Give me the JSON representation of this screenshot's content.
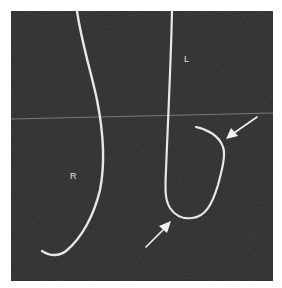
{
  "figure": {
    "type": "radiograph",
    "background_color": "#2b2b2b",
    "wire_color": "#e8e8e8",
    "reference_line_color": "#8a8a8a",
    "arrow_color": "#f2f2f2",
    "labels": {
      "right_side": "R",
      "left_side": "L"
    },
    "annotations": [
      {
        "name": "arrow-upper-right",
        "points_to": "curved wire tip bend"
      },
      {
        "name": "arrow-lower",
        "points_to": "J-loop bottom of wire"
      }
    ]
  }
}
